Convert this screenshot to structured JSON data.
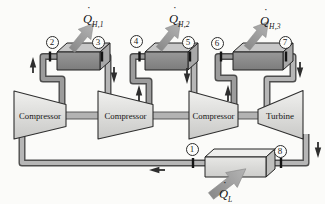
{
  "figure": {
    "type": "multistage-gas-cycle-schematic",
    "machines": {
      "compressor_1": "Compressor",
      "compressor_2": "Compressor",
      "compressor_3": "Compressor",
      "turbine": "Turbine"
    },
    "heat_flows": {
      "qh1": {
        "symbol": "Q",
        "dot": "·",
        "subscript": "H,1"
      },
      "qh2": {
        "symbol": "Q",
        "dot": "·",
        "subscript": "H,2"
      },
      "qh3": {
        "symbol": "Q",
        "dot": "·",
        "subscript": "H,3"
      },
      "ql": {
        "symbol": "Q",
        "dot": "·",
        "subscript": "L"
      }
    },
    "state_points": {
      "p1": "1",
      "p2": "2",
      "p3": "3",
      "p4": "4",
      "p5": "5",
      "p6": "6",
      "p7": "7",
      "p8": "8"
    },
    "colors": {
      "background": "#fbfbf9",
      "hx_front": "#8c8c8c",
      "hx_top": "#c7c7c7",
      "hx_side": "#a8a8a8",
      "machine_fill": "#e2e2e2",
      "pipe_fill": "#adadad",
      "pipe_outline": "#4d4d4d",
      "heat_arrow": "#9d9d9d",
      "flow_arrow": "#2e2e2e",
      "outline": "#222222"
    }
  }
}
